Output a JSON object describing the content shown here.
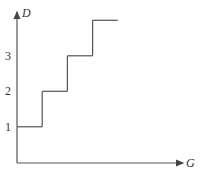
{
  "chart_data": {
    "type": "line",
    "subtype": "step",
    "title": "",
    "xlabel": "G",
    "ylabel": "D",
    "yticks": [
      "1",
      "2",
      "3"
    ],
    "steps": [
      {
        "x_start": 0,
        "x_end": 1,
        "y": 1
      },
      {
        "x_start": 1,
        "x_end": 2,
        "y": 2
      },
      {
        "x_start": 2,
        "x_end": 3,
        "y": 3
      },
      {
        "x_start": 3,
        "x_end": 4,
        "y": 4
      }
    ],
    "xlim": [
      0,
      6.5
    ],
    "ylim": [
      0,
      4.3
    ],
    "grid": false,
    "legend": "none"
  }
}
